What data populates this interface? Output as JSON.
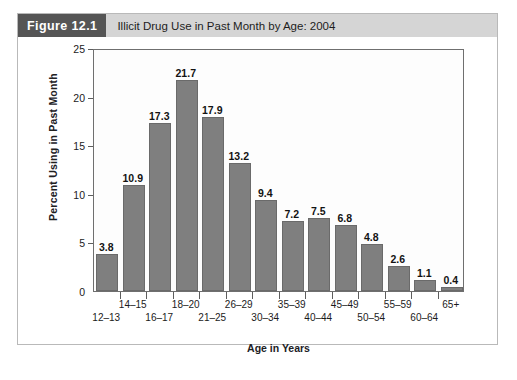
{
  "figure": {
    "badge": "Figure 12.1",
    "title": "Illicit Drug Use in Past Month by Age: 2004"
  },
  "colors": {
    "bar_fill": "#7f7f7f",
    "bar_stroke": "#6a6a6a",
    "badge_bg": "#555555",
    "header_bg": "#d5d5d5",
    "axis": "#6f6f6f",
    "figure_border": "#b9b9b9"
  },
  "chart_data": {
    "type": "bar",
    "title": "Illicit Drug Use in Past Month by Age: 2004",
    "xlabel": "Age in Years",
    "ylabel": "Percent Using in Past Month",
    "ylim": [
      0,
      25
    ],
    "yticks": [
      0,
      5,
      10,
      15,
      20,
      25
    ],
    "grid": false,
    "legend": "none",
    "categories": [
      "12–13",
      "14–15",
      "16–17",
      "18–20",
      "21–25",
      "26–29",
      "30–34",
      "35–39",
      "40–44",
      "45–49",
      "50–54",
      "55–59",
      "60–64",
      "65+"
    ],
    "values": [
      3.8,
      10.9,
      17.3,
      21.7,
      17.9,
      13.2,
      9.4,
      7.2,
      7.5,
      6.8,
      4.8,
      2.6,
      1.1,
      0.4
    ],
    "value_labels": [
      "3.8",
      "10.9",
      "17.3",
      "21.7",
      "17.9",
      "13.2",
      "9.4",
      "7.2",
      "7.5",
      "6.8",
      "4.8",
      "2.6",
      "1.1",
      "0.4"
    ]
  }
}
